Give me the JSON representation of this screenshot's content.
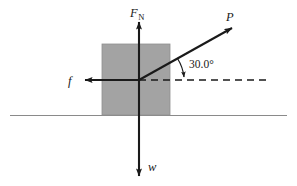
{
  "figure": {
    "type": "free-body-diagram",
    "background_color": "#ffffff",
    "stroke_color": "#1a1a1a",
    "ground_line_color": "#8a8a8a",
    "block": {
      "name": "block",
      "fill_color": "#a3a3a3",
      "x": 102,
      "y": 44,
      "width": 68,
      "height": 71
    },
    "origin": {
      "x": 139,
      "y": 80
    },
    "ground_line": {
      "y": 115,
      "x1": 10,
      "x2": 287
    }
  },
  "vectors": [
    {
      "id": "normal-force",
      "label": "F",
      "subscript": "N",
      "direction": "up",
      "label_x": 133,
      "label_y": 15,
      "x1": 139,
      "y1": 80,
      "x2": 139,
      "y2": 22
    },
    {
      "id": "applied-force",
      "label": "P",
      "subscript": "",
      "direction": "up-right-30deg",
      "label_x": 228,
      "label_y": 20,
      "x1": 139,
      "y1": 80,
      "x2": 232,
      "y2": 28
    },
    {
      "id": "friction-force",
      "label": "f",
      "subscript": "",
      "direction": "left",
      "label_x": 70,
      "label_y": 85,
      "x1": 139,
      "y1": 80,
      "x2": 85,
      "y2": 80
    },
    {
      "id": "weight-force",
      "label": "w",
      "subscript": "",
      "direction": "down",
      "label_x": 150,
      "label_y": 170,
      "x1": 139,
      "y1": 80,
      "x2": 139,
      "y2": 176
    }
  ],
  "angle": {
    "id": "angle-annotation",
    "value": "30.0",
    "unit": "°",
    "text": "30.0°",
    "label_x": 190,
    "label_y": 68,
    "between": [
      "applied-force",
      "horizontal-reference"
    ]
  },
  "reference_line": {
    "id": "horizontal-dashed-reference",
    "style": "dashed",
    "x1": 139,
    "y1": 80,
    "x2": 266,
    "y2": 80
  }
}
